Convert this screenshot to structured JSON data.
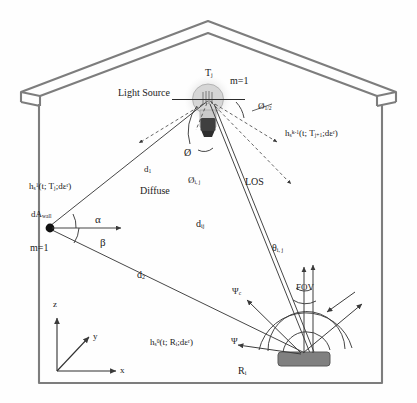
{
  "figure": {
    "type": "optical-wireless-channel-diagram",
    "scene": "indoor room cross-section with pitched roof",
    "colors": {
      "outline": "#7d7d7d",
      "ray": "#4a4a4a",
      "receiver_fill": "#808080",
      "bulb_glass": "#cfcfcf",
      "bulb_base": "#4a4a4a",
      "background": "#ffffff"
    }
  },
  "labels": {
    "light_source": "Light Source",
    "transmitter": {
      "base": "T",
      "sub": "j"
    },
    "mode_top": "m=1",
    "mode_left": "m=1",
    "half_angle": {
      "base": "Ø",
      "sub": "1/2"
    },
    "irradiance_angle": "Ø",
    "irradiance_angle_ij": {
      "base": "Ø",
      "sub": "i, j"
    },
    "los": "LOS",
    "diffuse": "Diffuse",
    "d1": {
      "base": "d",
      "sub": "1"
    },
    "d2": {
      "base": "d",
      "sub": "2"
    },
    "dij": {
      "base": "d",
      "sub": "ij"
    },
    "alpha": "α",
    "beta": "β",
    "theta_ij": {
      "base": "θ",
      "sub": "i, j"
    },
    "psi_c": {
      "base": "Ψ",
      "sub": "c"
    },
    "psi": "Ψ",
    "fov": "FOV",
    "receiver": {
      "base": "R",
      "sub": "i"
    },
    "da_wall": {
      "base": "dA",
      "sub": "wall"
    },
    "h_first_bounce": {
      "base": "h",
      "sub": "s",
      "sup": "1",
      "args": "(t; T",
      "argsub": "j",
      "argtail": ";dε",
      "argsup": "r",
      "close": ")"
    },
    "h_k_minus_1": {
      "base": "h",
      "sub": "s",
      "sup": "k-1",
      "args": "(t; T",
      "argsub": "j+1",
      "argtail": ";dε",
      "argsup": "r",
      "close": ")"
    },
    "h_zero": {
      "base": "h",
      "sub": "s",
      "sup": "0",
      "args": "(t; R",
      "argsub": "i",
      "argtail": ";dε",
      "argsup": "r",
      "close": ")"
    },
    "axis_x": "x",
    "axis_y": "y",
    "axis_z": "z"
  }
}
